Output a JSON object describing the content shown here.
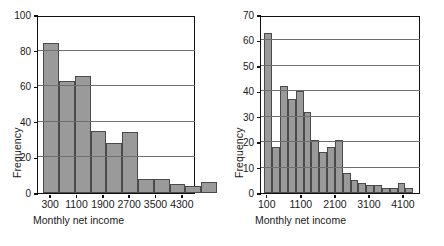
{
  "figure": {
    "background": "#ffffff",
    "bar_fill": "#9a9a9a",
    "bar_edge": "#4a4a4a",
    "axis_color": "#111111",
    "grid_color": "#6f6f6f"
  },
  "chart_data": [
    {
      "type": "bar",
      "title": "",
      "subtitle": "",
      "xlabel": "Monthly net income",
      "ylabel": "Frequency",
      "grid": true,
      "legend": "none",
      "ylim": [
        0,
        100
      ],
      "yticks": [
        0,
        20,
        40,
        60,
        80,
        100
      ],
      "ytick_labels": [
        "0",
        "20",
        "40",
        "60",
        "80",
        "100"
      ],
      "xlim": [
        -100,
        4700
      ],
      "xticks": [
        300,
        1100,
        1900,
        2700,
        3500,
        4300
      ],
      "xtick_labels": [
        "300",
        "1100",
        "1900",
        "2700",
        "3500",
        "4300"
      ],
      "bin_width": 480,
      "bin_starts": [
        60,
        540,
        1020,
        1500,
        1980,
        2460,
        2940,
        3420,
        3900,
        4380
      ],
      "categories": [
        "60-540",
        "540-1020",
        "1020-1500",
        "1500-1980",
        "1980-2460",
        "2460-2940",
        "2940-3420",
        "3420-3900",
        "3900-4380",
        "4380-4860"
      ],
      "values": [
        84,
        63,
        66,
        35,
        28,
        34,
        8,
        8,
        5,
        4,
        6
      ],
      "bars": [
        84,
        63,
        66,
        35,
        28,
        34,
        8,
        8,
        5,
        4,
        6
      ]
    },
    {
      "type": "bar",
      "title": "",
      "subtitle": "",
      "xlabel": "Monthly net income",
      "ylabel": "Frequency",
      "grid": true,
      "legend": "none",
      "ylim": [
        0,
        70
      ],
      "yticks": [
        0,
        10,
        20,
        30,
        40,
        50,
        60,
        70
      ],
      "ytick_labels": [
        "0",
        "10",
        "20",
        "30",
        "40",
        "50",
        "60",
        "70"
      ],
      "xlim": [
        -100,
        4600
      ],
      "xticks": [
        100,
        1100,
        2100,
        3100,
        4100
      ],
      "xtick_labels": [
        "100",
        "1100",
        "2100",
        "3100",
        "4100"
      ],
      "bin_width": 230,
      "bin_starts": [
        0,
        230,
        460,
        690,
        920,
        1150,
        1380,
        1610,
        1840,
        2070,
        2300,
        2530,
        2760,
        2990,
        3220,
        3450,
        3680,
        3910,
        4140,
        4370
      ],
      "categories": [
        "0-230",
        "230-460",
        "460-690",
        "690-920",
        "920-1150",
        "1150-1380",
        "1380-1610",
        "1610-1840",
        "1840-2070",
        "2070-2300",
        "2300-2530",
        "2530-2760",
        "2760-2990",
        "2990-3220",
        "3220-3450",
        "3450-3680",
        "3680-3910",
        "3910-4140",
        "4140-4370",
        "4370-4600"
      ],
      "values": [
        63,
        18,
        42,
        37,
        40,
        32,
        21,
        16,
        18,
        21,
        8,
        5,
        4,
        3,
        3,
        2,
        2,
        4,
        2
      ],
      "bars": [
        63,
        18,
        42,
        37,
        40,
        32,
        21,
        16,
        18,
        21,
        8,
        5,
        4,
        3,
        3,
        2,
        2,
        4,
        2
      ]
    }
  ],
  "panels": [
    {
      "name": "left-histogram",
      "xlabel": "Monthly net income",
      "ylabel": "Frequency"
    },
    {
      "name": "right-histogram",
      "xlabel": "Monthly net income",
      "ylabel": "Frequency"
    }
  ]
}
